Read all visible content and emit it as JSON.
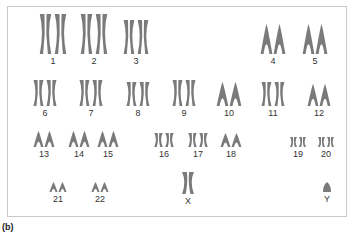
{
  "figure_label": "(b)",
  "colors": {
    "chromosome": "#7a7a7a",
    "frame": "#c8c8c8",
    "label": "#333333"
  },
  "chromosomes": [
    {
      "label": "1",
      "x": 38,
      "y": 14,
      "w": 30,
      "h": 40,
      "kind": "large-x"
    },
    {
      "label": "2",
      "x": 79,
      "y": 14,
      "w": 30,
      "h": 40,
      "kind": "large-split"
    },
    {
      "label": "3",
      "x": 122,
      "y": 20,
      "w": 28,
      "h": 34,
      "kind": "large-x"
    },
    {
      "label": "4",
      "x": 260,
      "y": 24,
      "w": 26,
      "h": 30,
      "kind": "acro-tall"
    },
    {
      "label": "5",
      "x": 302,
      "y": 24,
      "w": 26,
      "h": 30,
      "kind": "acro-tall"
    },
    {
      "label": "6",
      "x": 32,
      "y": 80,
      "w": 26,
      "h": 26,
      "kind": "mid-x"
    },
    {
      "label": "7",
      "x": 78,
      "y": 80,
      "w": 26,
      "h": 26,
      "kind": "mid-x"
    },
    {
      "label": "8",
      "x": 125,
      "y": 82,
      "w": 26,
      "h": 24,
      "kind": "mid-x"
    },
    {
      "label": "9",
      "x": 171,
      "y": 80,
      "w": 26,
      "h": 26,
      "kind": "mid-x"
    },
    {
      "label": "10",
      "x": 216,
      "y": 82,
      "w": 26,
      "h": 24,
      "kind": "mid-acro"
    },
    {
      "label": "11",
      "x": 260,
      "y": 82,
      "w": 26,
      "h": 24,
      "kind": "mid-x"
    },
    {
      "label": "12",
      "x": 307,
      "y": 84,
      "w": 24,
      "h": 22,
      "kind": "mid-acro"
    },
    {
      "label": "13",
      "x": 33,
      "y": 131,
      "w": 22,
      "h": 16,
      "kind": "small-acro"
    },
    {
      "label": "14",
      "x": 68,
      "y": 131,
      "w": 22,
      "h": 16,
      "kind": "small-acro"
    },
    {
      "label": "15",
      "x": 97,
      "y": 131,
      "w": 22,
      "h": 16,
      "kind": "small-acro"
    },
    {
      "label": "16",
      "x": 153,
      "y": 133,
      "w": 22,
      "h": 14,
      "kind": "small-x"
    },
    {
      "label": "17",
      "x": 187,
      "y": 133,
      "w": 22,
      "h": 14,
      "kind": "small-x"
    },
    {
      "label": "18",
      "x": 220,
      "y": 133,
      "w": 22,
      "h": 14,
      "kind": "small-acro"
    },
    {
      "label": "19",
      "x": 289,
      "y": 137,
      "w": 18,
      "h": 10,
      "kind": "tiny-x"
    },
    {
      "label": "20",
      "x": 317,
      "y": 137,
      "w": 18,
      "h": 10,
      "kind": "tiny-x"
    },
    {
      "label": "21",
      "x": 49,
      "y": 182,
      "w": 18,
      "h": 10,
      "kind": "tiny-acro"
    },
    {
      "label": "22",
      "x": 91,
      "y": 182,
      "w": 18,
      "h": 10,
      "kind": "tiny-acro"
    },
    {
      "label": "X",
      "x": 181,
      "y": 172,
      "w": 14,
      "h": 22,
      "kind": "single-x"
    },
    {
      "label": "Y",
      "x": 323,
      "y": 182,
      "w": 8,
      "h": 10,
      "kind": "single-y"
    }
  ]
}
